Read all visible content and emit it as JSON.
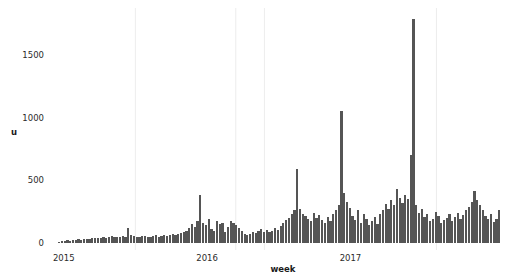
{
  "chart_data": {
    "type": "bar",
    "title": "",
    "subtitle": "",
    "xlabel": "week",
    "ylabel": "u",
    "xlim": [
      2014.96,
      2018.05
    ],
    "ylim": [
      0,
      1810
    ],
    "yticks": [
      0,
      500,
      1000,
      1500
    ],
    "ytick_labels": [
      "0",
      "500",
      "1000",
      "1500"
    ],
    "xticks": [
      2015,
      2016,
      2017
    ],
    "xtick_labels": [
      "2015",
      "2016",
      "2017"
    ],
    "gridlines_x": [
      2015.5,
      2016.2,
      2016.4,
      2017.6
    ],
    "grid": true,
    "legend": "none",
    "bar_color": "#555555",
    "grid_color": "#e9e9e9",
    "text_color": "#2b2b2b",
    "background": "#ffffff",
    "n_bars": 160,
    "x_start": 2015.0,
    "x_step": 0.019230769,
    "values": [
      12,
      16,
      14,
      20,
      18,
      24,
      22,
      28,
      26,
      30,
      34,
      30,
      36,
      40,
      36,
      42,
      46,
      40,
      48,
      52,
      46,
      44,
      50,
      56,
      48,
      118,
      62,
      54,
      50,
      46,
      58,
      52,
      48,
      44,
      54,
      60,
      50,
      56,
      62,
      58,
      66,
      72,
      64,
      70,
      78,
      86,
      96,
      120,
      150,
      128,
      175,
      380,
      160,
      140,
      190,
      110,
      95,
      175,
      150,
      160,
      88,
      130,
      175,
      160,
      140,
      120,
      95,
      70,
      62,
      74,
      88,
      80,
      96,
      112,
      90,
      104,
      86,
      94,
      118,
      106,
      132,
      160,
      185,
      200,
      235,
      260,
      590,
      270,
      230,
      215,
      190,
      175,
      240,
      200,
      225,
      185,
      160,
      210,
      175,
      230,
      265,
      300,
      1050,
      400,
      330,
      280,
      215,
      185,
      260,
      160,
      230,
      195,
      145,
      175,
      210,
      150,
      230,
      260,
      310,
      270,
      340,
      300,
      430,
      360,
      320,
      380,
      350,
      700,
      1785,
      300,
      240,
      270,
      205,
      230,
      175,
      190,
      250,
      215,
      160,
      185,
      200,
      230,
      175,
      210,
      240,
      190,
      220,
      265,
      290,
      330,
      415,
      340,
      300,
      260,
      215,
      190,
      235,
      165,
      195,
      265
    ]
  }
}
